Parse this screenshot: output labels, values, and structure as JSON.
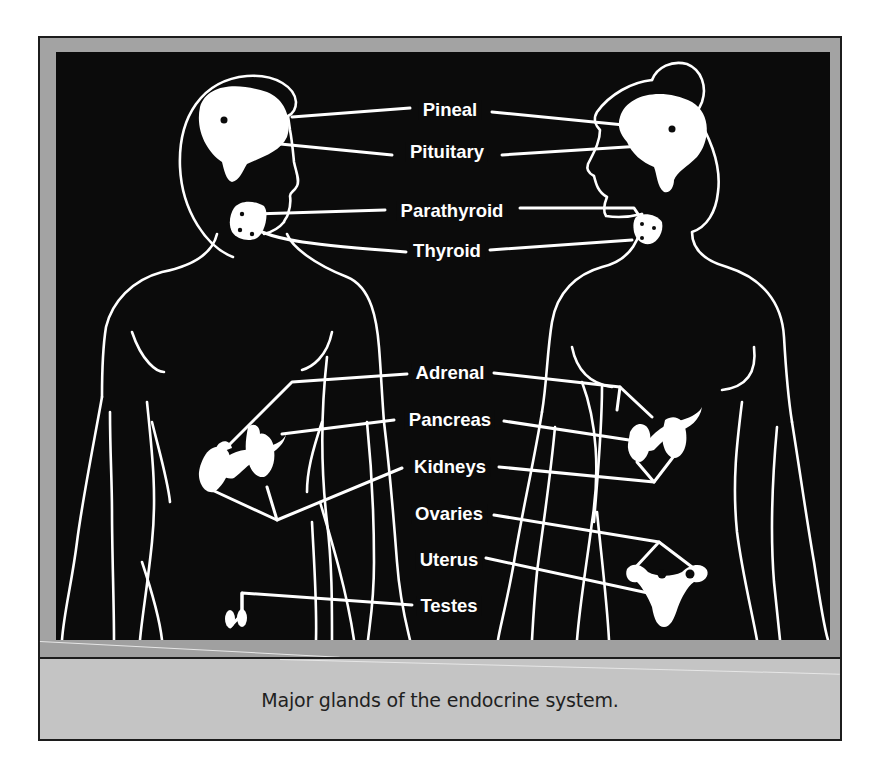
{
  "figure": {
    "title": "Major glands of the endocrine system.",
    "labels": [
      {
        "id": "pineal",
        "text": "Pineal",
        "x": 448,
        "y": 108
      },
      {
        "id": "pituitary",
        "text": "Pituitary",
        "x": 445,
        "y": 150
      },
      {
        "id": "parathyroid",
        "text": "Parathyroid",
        "x": 450,
        "y": 209
      },
      {
        "id": "thyroid",
        "text": "Thyroid",
        "x": 445,
        "y": 249
      },
      {
        "id": "adrenal",
        "text": "Adrenal",
        "x": 448,
        "y": 371
      },
      {
        "id": "pancreas",
        "text": "Pancreas",
        "x": 448,
        "y": 418
      },
      {
        "id": "kidneys",
        "text": "Kidneys",
        "x": 448,
        "y": 465
      },
      {
        "id": "ovaries",
        "text": "Ovaries",
        "x": 447,
        "y": 512
      },
      {
        "id": "uterus",
        "text": "Uterus",
        "x": 447,
        "y": 558
      },
      {
        "id": "testes",
        "text": "Testes",
        "x": 447,
        "y": 604
      }
    ],
    "figures": [
      "male-body-outline",
      "female-body-outline"
    ],
    "colors": {
      "background": "#0b0b0b",
      "lines": "#ffffff",
      "frame": "#a3a3a3",
      "caption_bg": "#c4c4c4",
      "caption_text": "#1f1f1f"
    }
  }
}
